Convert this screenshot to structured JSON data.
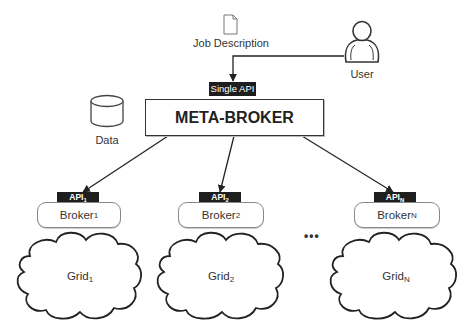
{
  "diagram": {
    "job_description": {
      "label": "Job Description",
      "icon": "document-icon"
    },
    "user": {
      "label": "User",
      "icon": "user-icon"
    },
    "data_store": {
      "label": "Data",
      "icon": "database-icon"
    },
    "single_api": {
      "label": "Single API"
    },
    "meta_broker": {
      "label": "META-BROKER"
    },
    "ellipsis": "•••",
    "columns": [
      {
        "api": "API",
        "api_sub": "1",
        "broker": "Broker",
        "broker_sub": "1",
        "grid": "Grid",
        "grid_sub": "1"
      },
      {
        "api": "API",
        "api_sub": "2",
        "broker": "Broker",
        "broker_sub": "2",
        "grid": "Grid",
        "grid_sub": "2"
      },
      {
        "api": "API",
        "api_sub": "N",
        "broker": "Broker",
        "broker_sub": "N",
        "grid": "Grid",
        "grid_sub": "N"
      }
    ],
    "edges": [
      {
        "from": "User",
        "to": "Single API"
      },
      {
        "from": "META-BROKER",
        "to": "API 1"
      },
      {
        "from": "META-BROKER",
        "to": "API 2"
      },
      {
        "from": "META-BROKER",
        "to": "API N"
      }
    ]
  }
}
